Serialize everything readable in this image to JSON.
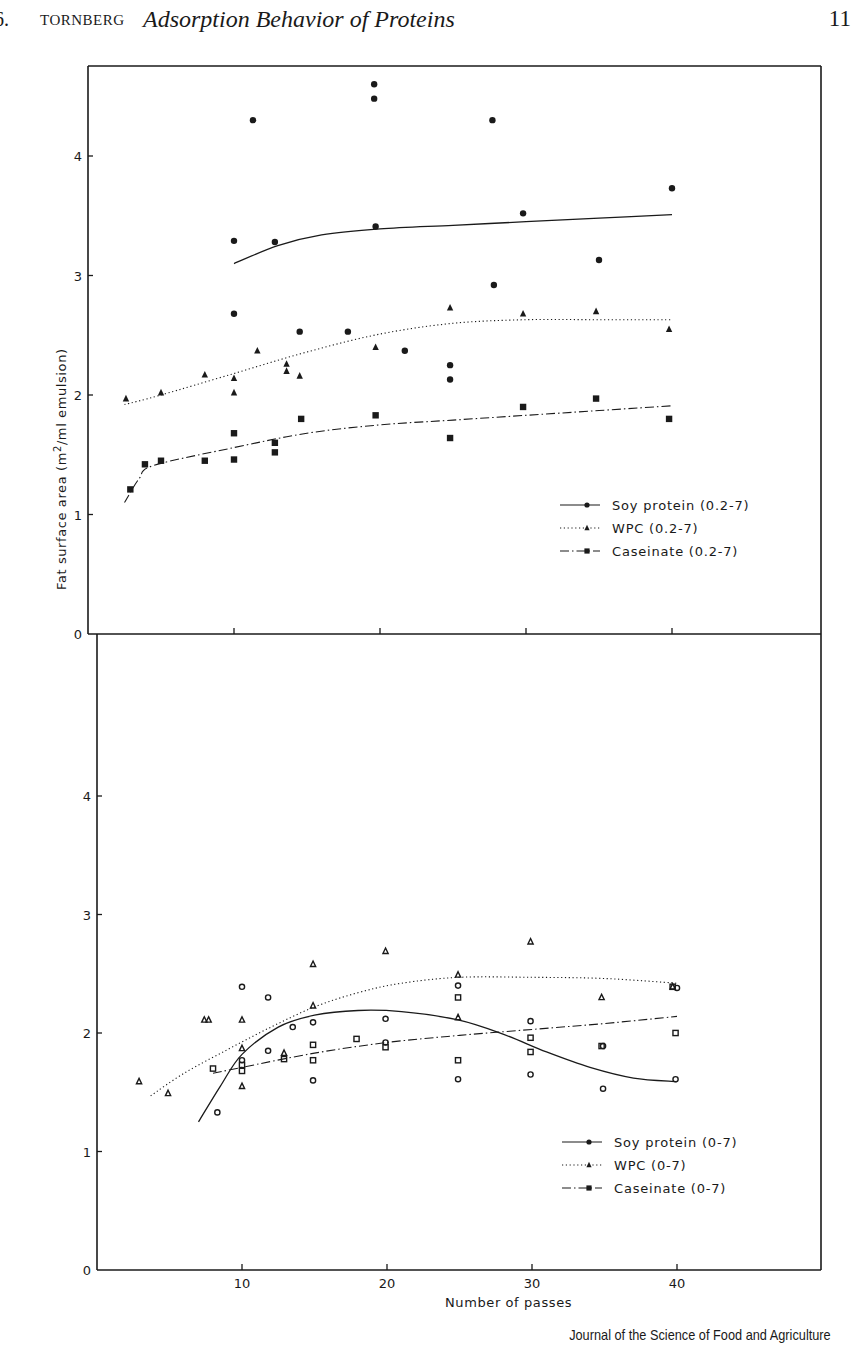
{
  "header": {
    "chapter": "6.",
    "author": "TORNBERG",
    "title": "Adsorption Behavior of Proteins",
    "page_number": "11"
  },
  "credit": "Journal of the Science of Food and Agriculture",
  "colors": {
    "ink": "#1a1a1a",
    "background": "#ffffff"
  },
  "chart_data": [
    {
      "type": "scatter",
      "panel": "top",
      "title": "",
      "xlabel": "",
      "ylabel": "Fat surface area  (m2/ml emulsion)",
      "xlim": [
        0,
        50
      ],
      "ylim": [
        0,
        4.7
      ],
      "x_ticks": [
        10,
        20,
        30,
        40
      ],
      "x_tick_labels": [],
      "y_ticks": [
        0,
        1,
        2,
        3,
        4
      ],
      "y_tick_labels": [
        "0",
        "1",
        "2",
        "3",
        "4"
      ],
      "grid": false,
      "legend_position": "lower right",
      "series": [
        {
          "name": "Soy protein (0.2-7)",
          "marker": "filled-circle",
          "line": "solid",
          "points": [
            [
              10,
              3.29
            ],
            [
              10,
              2.68
            ],
            [
              11.3,
              4.3
            ],
            [
              12.8,
              3.28
            ],
            [
              14.5,
              2.53
            ],
            [
              17.8,
              2.53
            ],
            [
              19.6,
              4.6
            ],
            [
              19.6,
              4.48
            ],
            [
              19.7,
              3.41
            ],
            [
              21.7,
              2.37
            ],
            [
              24.8,
              2.25
            ],
            [
              24.8,
              2.13
            ],
            [
              27.7,
              4.3
            ],
            [
              27.8,
              2.92
            ],
            [
              29.8,
              3.52
            ],
            [
              35.0,
              3.13
            ],
            [
              40.0,
              3.73
            ]
          ],
          "fit": [
            [
              10,
              3.1
            ],
            [
              13,
              3.25
            ],
            [
              16,
              3.34
            ],
            [
              20,
              3.39
            ],
            [
              25,
              3.42
            ],
            [
              30,
              3.45
            ],
            [
              35,
              3.48
            ],
            [
              40,
              3.51
            ]
          ]
        },
        {
          "name": "WPC (0.2-7)",
          "marker": "filled-triangle",
          "line": "dotted",
          "points": [
            [
              2.6,
              1.97
            ],
            [
              5.0,
              2.02
            ],
            [
              8.0,
              2.17
            ],
            [
              10,
              2.14
            ],
            [
              10,
              2.02
            ],
            [
              11.6,
              2.37
            ],
            [
              13.6,
              2.26
            ],
            [
              13.6,
              2.2
            ],
            [
              14.5,
              2.16
            ],
            [
              19.7,
              2.4
            ],
            [
              24.8,
              2.73
            ],
            [
              29.8,
              2.68
            ],
            [
              34.8,
              2.7
            ],
            [
              39.8,
              2.55
            ]
          ],
          "fit": [
            [
              2.5,
              1.92
            ],
            [
              5,
              2.0
            ],
            [
              10,
              2.18
            ],
            [
              15,
              2.36
            ],
            [
              20,
              2.51
            ],
            [
              25,
              2.6
            ],
            [
              30,
              2.63
            ],
            [
              35,
              2.63
            ],
            [
              40,
              2.63
            ]
          ]
        },
        {
          "name": "Caseinate (0.2-7)",
          "marker": "filled-square",
          "line": "dash-dot",
          "points": [
            [
              2.9,
              1.21
            ],
            [
              3.9,
              1.42
            ],
            [
              5.0,
              1.45
            ],
            [
              8.0,
              1.45
            ],
            [
              10,
              1.68
            ],
            [
              10,
              1.46
            ],
            [
              12.8,
              1.6
            ],
            [
              12.8,
              1.52
            ],
            [
              14.6,
              1.8
            ],
            [
              19.7,
              1.83
            ],
            [
              24.8,
              1.64
            ],
            [
              29.8,
              1.9
            ],
            [
              34.8,
              1.97
            ],
            [
              39.8,
              1.8
            ]
          ],
          "fit": [
            [
              2.5,
              1.1
            ],
            [
              3.5,
              1.3
            ],
            [
              4.5,
              1.41
            ],
            [
              10,
              1.56
            ],
            [
              15,
              1.68
            ],
            [
              20,
              1.75
            ],
            [
              25,
              1.79
            ],
            [
              30,
              1.83
            ],
            [
              35,
              1.87
            ],
            [
              40,
              1.91
            ]
          ]
        }
      ]
    },
    {
      "type": "scatter",
      "panel": "bottom",
      "title": "",
      "xlabel": "Number of passes",
      "ylabel": "Fat surface area  (m2/ml emulsion)",
      "xlim": [
        0,
        50
      ],
      "ylim": [
        0,
        4.7
      ],
      "x_ticks": [
        10,
        20,
        30,
        40
      ],
      "x_tick_labels": [
        "10",
        "20",
        "30",
        "40"
      ],
      "y_ticks": [
        0,
        1,
        2,
        3,
        4
      ],
      "y_tick_labels": [
        "0",
        "1",
        "2",
        "3",
        "4"
      ],
      "grid": false,
      "legend_position": "lower right",
      "series": [
        {
          "name": "Soy protein (0-7)",
          "marker": "open-circle",
          "line": "solid",
          "points": [
            [
              8.3,
              1.33
            ],
            [
              10,
              2.39
            ],
            [
              10,
              1.77
            ],
            [
              11.8,
              1.85
            ],
            [
              11.8,
              2.3
            ],
            [
              13.5,
              2.05
            ],
            [
              14.9,
              2.09
            ],
            [
              14.9,
              1.6
            ],
            [
              19.9,
              2.12
            ],
            [
              19.9,
              1.92
            ],
            [
              24.9,
              2.4
            ],
            [
              24.9,
              1.61
            ],
            [
              29.9,
              2.1
            ],
            [
              29.9,
              1.65
            ],
            [
              34.9,
              1.53
            ],
            [
              34.9,
              1.89
            ],
            [
              39.9,
              1.61
            ],
            [
              40.0,
              2.38
            ]
          ],
          "fit": [
            [
              7,
              1.25
            ],
            [
              8.5,
              1.55
            ],
            [
              10,
              1.82
            ],
            [
              12.5,
              2.05
            ],
            [
              15,
              2.15
            ],
            [
              18,
              2.19
            ],
            [
              21,
              2.18
            ],
            [
              24.9,
              2.11
            ],
            [
              28,
              1.99
            ],
            [
              31,
              1.84
            ],
            [
              34,
              1.71
            ],
            [
              37,
              1.62
            ],
            [
              40,
              1.59
            ]
          ]
        },
        {
          "name": "WPC (0-7)",
          "marker": "open-triangle",
          "line": "dotted",
          "points": [
            [
              2.9,
              1.59
            ],
            [
              4.9,
              1.49
            ],
            [
              7.4,
              2.11
            ],
            [
              7.7,
              2.11
            ],
            [
              10,
              2.11
            ],
            [
              10,
              1.87
            ],
            [
              10,
              1.55
            ],
            [
              14.9,
              2.58
            ],
            [
              14.9,
              2.23
            ],
            [
              19.9,
              2.69
            ],
            [
              24.9,
              2.49
            ],
            [
              24.9,
              2.13
            ],
            [
              29.9,
              2.77
            ],
            [
              34.8,
              2.3
            ],
            [
              39.7,
              2.39
            ],
            [
              12.9,
              1.83
            ]
          ],
          "fit": [
            [
              3.7,
              1.47
            ],
            [
              6,
              1.66
            ],
            [
              9,
              1.86
            ],
            [
              12,
              2.05
            ],
            [
              15,
              2.22
            ],
            [
              18,
              2.34
            ],
            [
              21,
              2.42
            ],
            [
              25,
              2.47
            ],
            [
              30,
              2.47
            ],
            [
              35,
              2.46
            ],
            [
              40,
              2.42
            ]
          ]
        },
        {
          "name": "Caseinate (0-7)",
          "marker": "open-square",
          "line": "dash-dot",
          "points": [
            [
              8.0,
              1.7
            ],
            [
              10,
              1.73
            ],
            [
              10,
              1.68
            ],
            [
              12.9,
              1.78
            ],
            [
              14.9,
              1.9
            ],
            [
              14.9,
              1.77
            ],
            [
              17.9,
              1.95
            ],
            [
              19.9,
              1.88
            ],
            [
              24.9,
              2.3
            ],
            [
              24.9,
              1.77
            ],
            [
              29.9,
              1.96
            ],
            [
              29.9,
              1.84
            ],
            [
              34.8,
              1.89
            ],
            [
              39.9,
              2.0
            ],
            [
              39.7,
              2.39
            ]
          ],
          "fit": [
            [
              8,
              1.66
            ],
            [
              10,
              1.71
            ],
            [
              15,
              1.83
            ],
            [
              20,
              1.92
            ],
            [
              25,
              1.98
            ],
            [
              30,
              2.03
            ],
            [
              35,
              2.08
            ],
            [
              40,
              2.14
            ]
          ]
        }
      ]
    }
  ]
}
